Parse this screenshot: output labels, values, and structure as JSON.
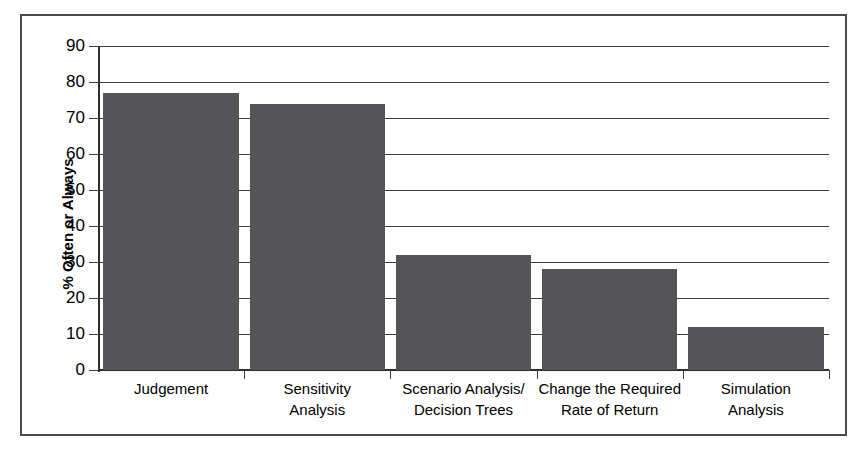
{
  "chart_data": {
    "type": "bar",
    "title": "",
    "xlabel": "",
    "ylabel": "% Often or Always",
    "ylim": [
      0,
      90
    ],
    "ytick_step": 10,
    "grid": true,
    "legend": false,
    "bar_color": "#555558",
    "axis_color": "#3c3c3c",
    "frame_color": "#4a4a4a",
    "categories": [
      "Judgement",
      "Sensitivity Analysis",
      "Scenario Analysis/ Decision Trees",
      "Change the Required Rate of Return",
      "Simulation Analysis"
    ],
    "category_lines": [
      [
        "Judgement"
      ],
      [
        "Sensitivity",
        "Analysis"
      ],
      [
        "Scenario Analysis/",
        "Decision Trees"
      ],
      [
        "Change the Required",
        "Rate of Return"
      ],
      [
        "Simulation",
        "Analysis"
      ]
    ],
    "values": [
      77,
      74,
      32,
      28,
      12
    ],
    "yticks": [
      90,
      80,
      70,
      60,
      50,
      40,
      30,
      20,
      10,
      0
    ],
    "ytick_labels": [
      "90",
      "80",
      "70",
      "60",
      "50",
      "40",
      "30",
      "20",
      "10",
      "0"
    ]
  }
}
